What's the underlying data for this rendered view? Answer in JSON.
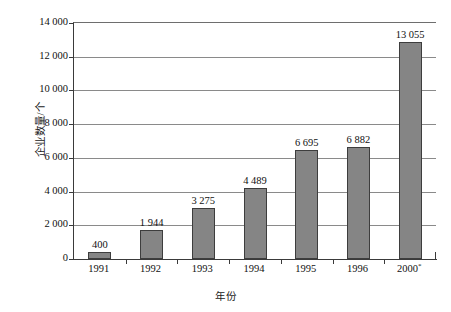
{
  "chart_data": {
    "type": "bar",
    "title": "",
    "xlabel": "年份",
    "ylabel": "企业数量/个",
    "categories": [
      "1991",
      "1992",
      "1993",
      "1994",
      "1995",
      "1996",
      "2000*"
    ],
    "values": [
      400,
      1944,
      3275,
      4489,
      6695,
      6882,
      13055
    ],
    "value_labels": [
      "400",
      "1 944",
      "3 275",
      "4 489",
      "6 695",
      "6 882",
      "13 055"
    ],
    "bar_heights": [
      400,
      1700,
      3050,
      4200,
      6450,
      6650,
      12850
    ],
    "ylim": [
      0,
      14000
    ],
    "ytick_values": [
      0,
      2000,
      4000,
      6000,
      8000,
      10000,
      12000,
      14000
    ],
    "ytick_labels": [
      "0",
      "2 000",
      "4 000",
      "6 000",
      "8 000",
      "10 000",
      "12 000",
      "14 000"
    ],
    "grid": true,
    "legend": false,
    "colors": {
      "bar_fill": "#858585",
      "bar_border": "#3d3d3d",
      "gridline": "#8a8a8a",
      "axis": "#3a3a3a",
      "text": "#111111",
      "background": "#ffffff"
    },
    "note_marker": "*"
  }
}
